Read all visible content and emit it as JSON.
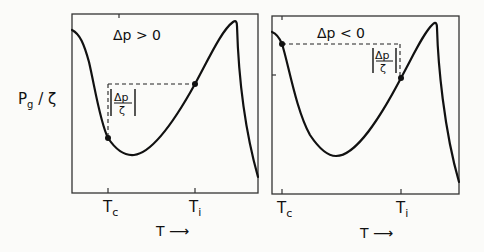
{
  "figure": {
    "y_axis_label": {
      "main": "P",
      "sub": "g",
      "rest": " / ζ"
    },
    "panels": [
      {
        "condition": "Δp > 0",
        "annotation": {
          "num": "Δp",
          "den": "ζ"
        },
        "x_ticks": [
          {
            "main": "T",
            "sub": "c"
          },
          {
            "main": "T",
            "sub": "i"
          }
        ],
        "x_axis_label": "T ⟶"
      },
      {
        "condition": "Δp < 0",
        "annotation": {
          "num": "Δp",
          "den": "ζ"
        },
        "x_ticks": [
          {
            "main": "T",
            "sub": "c"
          },
          {
            "main": "T",
            "sub": "i"
          }
        ],
        "x_axis_label": "T ⟶"
      }
    ]
  },
  "colors": {
    "ink": "#111111",
    "background": "#fbfbf9"
  }
}
